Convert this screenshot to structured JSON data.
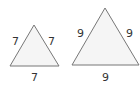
{
  "diagram": {
    "triangles": [
      {
        "name": "small-equilateral-triangle",
        "points": "34,25 10,66 59,66",
        "side_labels": {
          "left": "7",
          "right": "7",
          "bottom": "7"
        },
        "label_pos": {
          "left": [
            16,
            45
          ],
          "right": [
            49,
            45
          ],
          "bottom": [
            31,
            80
          ]
        }
      },
      {
        "name": "large-equilateral-triangle",
        "points": "105,8 72,65 139,65",
        "side_labels": {
          "left": "9",
          "right": "9",
          "bottom": "9"
        },
        "label_pos": {
          "left": [
            78,
            37
          ],
          "right": [
            126,
            37
          ],
          "bottom": [
            102,
            80
          ]
        }
      }
    ],
    "fill": "#f5f5f5",
    "stroke": "#777777"
  }
}
